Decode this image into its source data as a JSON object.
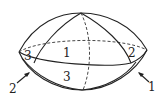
{
  "figure": {
    "region_labels": [
      {
        "id": "left-region",
        "text": "3"
      },
      {
        "id": "center-region",
        "text": "1"
      },
      {
        "id": "right-region",
        "text": "2"
      },
      {
        "id": "bottom-region",
        "text": "3"
      }
    ],
    "pointer_labels": [
      {
        "id": "pointer-left",
        "text": "2"
      },
      {
        "id": "pointer-right",
        "text": "1"
      }
    ],
    "colors": {
      "stroke": "#222222",
      "background": "#ffffff"
    }
  }
}
